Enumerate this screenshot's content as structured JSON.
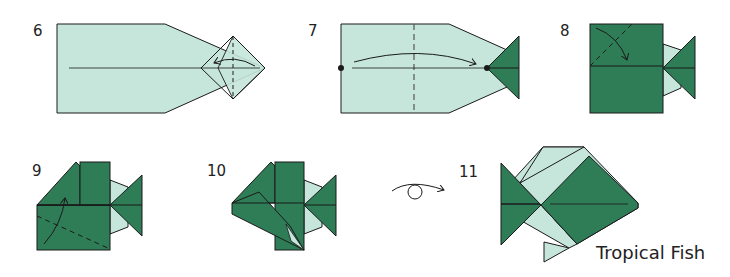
{
  "diagram": {
    "title": "Tropical Fish",
    "steps": [
      {
        "number": "6"
      },
      {
        "number": "7"
      },
      {
        "number": "8"
      },
      {
        "number": "9"
      },
      {
        "number": "10"
      },
      {
        "number": "11"
      }
    ],
    "colors": {
      "light_paper": "#c6e6dc",
      "dark_paper": "#2e7d57",
      "line": "#1a1a1a"
    }
  }
}
